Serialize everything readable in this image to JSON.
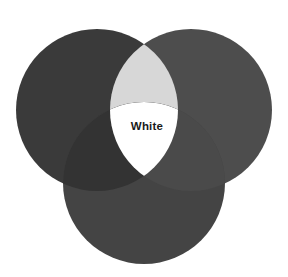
{
  "figure": {
    "name": "additive-color-venn-diagram",
    "kind": "venn-diagram",
    "width": 288,
    "height": 277,
    "background_color": "#ffffff"
  },
  "chart_data": {
    "type": "venn",
    "title": "",
    "subtitle": "",
    "xlabel": "",
    "ylabel": "",
    "grid": false,
    "legend": "none",
    "set_count": 3,
    "sets": [
      {
        "id": "left",
        "label": "",
        "color": "#3a3a3a",
        "cx": 97,
        "cy": 110,
        "r": 81
      },
      {
        "id": "right",
        "label": "",
        "color": "#4d4d4d",
        "cx": 191,
        "cy": 110,
        "r": 81
      },
      {
        "id": "bottom",
        "label": "",
        "color": "#444444",
        "cx": 144,
        "cy": 183,
        "r": 81
      }
    ],
    "regions": [
      {
        "id": "left-only",
        "sets": [
          "left"
        ],
        "color": "#3a3a3a",
        "label": ""
      },
      {
        "id": "right-only",
        "sets": [
          "right"
        ],
        "color": "#4d4d4d",
        "label": ""
      },
      {
        "id": "bottom-only",
        "sets": [
          "bottom"
        ],
        "color": "#444444",
        "label": ""
      },
      {
        "id": "left-right",
        "sets": [
          "left",
          "right"
        ],
        "color": "#d7d7d7",
        "label": ""
      },
      {
        "id": "left-bottom",
        "sets": [
          "left",
          "bottom"
        ],
        "color": "#333333",
        "label": ""
      },
      {
        "id": "right-bottom",
        "sets": [
          "right",
          "bottom"
        ],
        "color": "#4a4a4a",
        "label": ""
      },
      {
        "id": "all-three",
        "sets": [
          "left",
          "right",
          "bottom"
        ],
        "color": "#ffffff",
        "label": "White"
      }
    ],
    "annotations": [
      {
        "id": "center-label",
        "text": "White",
        "x": 147,
        "y": 127,
        "color": "#1a1a1a"
      }
    ]
  }
}
